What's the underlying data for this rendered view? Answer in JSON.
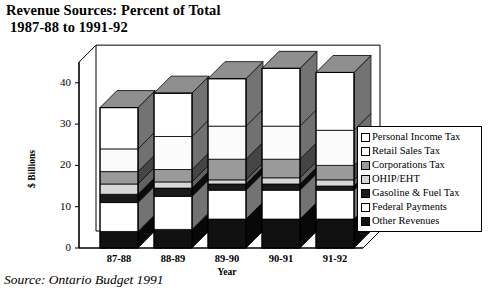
{
  "title": {
    "line1": "Revenue Sources: Percent of Total",
    "line2": "1987-88 to 1991-92"
  },
  "source": "Source: Ontario Budget 1991",
  "legend": {
    "position": "right",
    "items": [
      {
        "label": "Personal Income Tax",
        "color": "#ffffff"
      },
      {
        "label": "Retail Sales Tax",
        "color": "#ffffff"
      },
      {
        "label": "Corporations Tax",
        "color": "#9a9a9a"
      },
      {
        "label": "OHIP/EHT",
        "color": "#d8d8d8"
      },
      {
        "label": "Gasoline & Fuel Tax",
        "color": "#1a1a1a"
      },
      {
        "label": "Federal Payments",
        "color": "#ffffff"
      },
      {
        "label": "Other Revenues",
        "color": "#111111"
      }
    ]
  },
  "axes": {
    "y_title": "$ Billions",
    "x_title": "Year",
    "y_ticks": [
      "0",
      "10",
      "20",
      "30",
      "40"
    ],
    "x_ticks": [
      "87-88",
      "88-89",
      "89-90",
      "90-91",
      "91-92"
    ]
  },
  "chart_data": {
    "type": "bar",
    "stacked": true,
    "title": "Revenue Sources: Percent of Total 1987-88 to 1991-92",
    "xlabel": "Year",
    "ylabel": "$ Billions",
    "ylim": [
      0,
      45
    ],
    "yticks": [
      0,
      10,
      20,
      30,
      40
    ],
    "grid": false,
    "legend_position": "right",
    "categories": [
      "87-88",
      "88-89",
      "89-90",
      "90-91",
      "91-92"
    ],
    "stack_order_bottom_to_top": [
      "Other Revenues",
      "Federal Payments",
      "Gasoline & Fuel Tax",
      "OHIP/EHT",
      "Corporations Tax",
      "Retail Sales Tax",
      "Personal Income Tax"
    ],
    "series": [
      {
        "name": "Other Revenues",
        "color": "#111111",
        "values": [
          4.0,
          4.5,
          7.0,
          7.0,
          7.0
        ]
      },
      {
        "name": "Federal Payments",
        "color": "#ffffff",
        "values": [
          7.0,
          8.0,
          7.0,
          7.0,
          7.0
        ]
      },
      {
        "name": "Gasoline & Fuel Tax",
        "color": "#1a1a1a",
        "values": [
          2.0,
          2.0,
          1.5,
          1.5,
          1.0
        ]
      },
      {
        "name": "OHIP/EHT",
        "color": "#d8d8d8",
        "values": [
          2.5,
          1.5,
          1.0,
          1.5,
          1.5
        ]
      },
      {
        "name": "Corporations Tax",
        "color": "#9a9a9a",
        "values": [
          3.0,
          3.0,
          5.0,
          4.5,
          3.5
        ]
      },
      {
        "name": "Retail Sales Tax",
        "color": "#fbfbfb",
        "values": [
          5.5,
          8.0,
          8.0,
          8.0,
          8.5
        ]
      },
      {
        "name": "Personal Income Tax",
        "color": "#ffffff",
        "values": [
          10.0,
          10.5,
          11.5,
          14.0,
          14.0
        ]
      }
    ],
    "totals": [
      34.0,
      37.5,
      41.0,
      43.5,
      42.5
    ]
  }
}
